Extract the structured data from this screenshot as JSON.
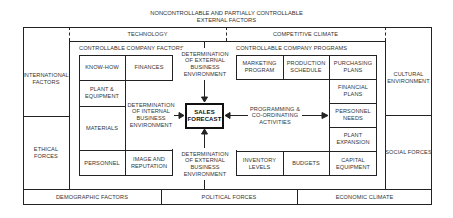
{
  "title": [
    "NONCONTROLLABLE AND PARTIALLY CONTROLLABLE",
    "EXTERNAL FACTORS"
  ],
  "top_band": {
    "left": "TECHNOLOGY",
    "right": "COMPETITIVE CLIMATE"
  },
  "left_column": {
    "top": "INTERNATIONAL FACTORS",
    "bottom": "ETHICAL FORCES"
  },
  "right_column": {
    "top": "CULTURAL ENVIRONMENT",
    "bottom": "SOCIAL FORCES"
  },
  "bottom_band": {
    "left": "DEMOGRAPHIC FACTORS",
    "middle": "POLITICAL FORCES",
    "right": "ECONOMIC CLIMATE"
  },
  "factors": {
    "heading": "CONTROLLABLE COMPANY FACTORS",
    "know_how": "KNOW-HOW",
    "finances": "FINANCES",
    "plant_equipment": "PLANT & EQUIPMENT",
    "materials": "MATERIALS",
    "personnel": "PERSONNEL",
    "image_reputation": "IMAGE AND REPUTATION",
    "internal_determination": "DETERMINATION OF INTERNAL BUSINESS ENVIRONMENT"
  },
  "programs": {
    "heading": "CONTROLLABLE COMPANY PROGRAMS",
    "marketing": "MARKETING PROGRAM",
    "production": "PRODUCTION SCHEDULE",
    "purchasing": "PURCHASING PLANS",
    "financial": "FINANCIAL PLANS",
    "personnel_needs": "PERSONNEL NEEDS",
    "plant_expansion": "PLANT EXPANSION",
    "inventory": "INVENTORY LEVELS",
    "budgets": "BUDGETS",
    "capital": "CAPITAL EQUIPMENT",
    "coordination": "PROGRAMMING & CO-ORDINATING ACTIVITIES"
  },
  "center": {
    "sales_forecast": "SALES FORECAST",
    "external_top": "DETERMINATION OF EXTERNAL BUSINESS ENVIRONMENT",
    "external_bottom": "DETERMINATION OF EXTERNAL BUSINESS ENVIRONMENT"
  }
}
